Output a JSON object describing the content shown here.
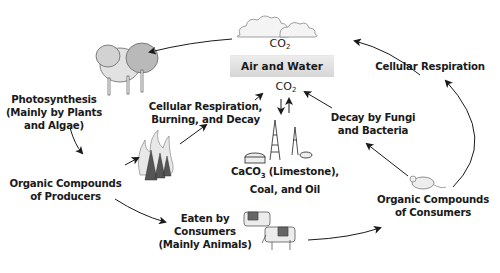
{
  "diagram": {
    "center_box": "Air and Water",
    "co2_top": "CO",
    "co2_center": "CO",
    "subscript_2": "2",
    "nodes": {
      "photosynthesis": [
        "Photosynthesis",
        "(Mainly by Plants",
        "and Algae)"
      ],
      "cellular_respiration_top": [
        "Cellular Respiration"
      ],
      "cellular_respiration_burning": [
        "Cellular Respiration,",
        "Burning, and Decay"
      ],
      "decay": [
        "Decay by Fungi",
        "and Bacteria"
      ],
      "limestone": [
        "CaCO",
        "3",
        " (Limestone),",
        "Coal, and Oil"
      ],
      "organic_producers": [
        "Organic Compounds",
        "of Producers"
      ],
      "eaten": [
        "Eaten by",
        "Consumers",
        "(Mainly Animals)"
      ],
      "organic_consumers": [
        "Organic Compounds",
        "of Consumers"
      ]
    },
    "illustrations": [
      "clouds",
      "trees",
      "burning-trees",
      "oil-derricks",
      "mouse",
      "cows"
    ],
    "colors": {
      "arrow": "#1a1a1a",
      "box": "#dcdcdc",
      "text": "#1a1a1a"
    }
  }
}
